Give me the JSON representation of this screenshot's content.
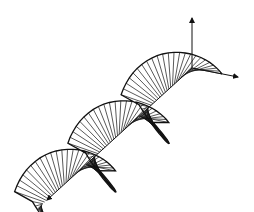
{
  "figure": {
    "width": 254,
    "height": 212,
    "background": "#ffffff",
    "stroke_color": "#111111"
  },
  "axes": {
    "origin": [
      192,
      68
    ],
    "vertical_axis": {
      "name": "vertical-axis",
      "end": [
        192,
        18
      ]
    },
    "transverse_axis": {
      "name": "transverse-axis",
      "end": [
        238,
        77
      ]
    },
    "propagation_axis": {
      "name": "propagation-axis",
      "end": [
        47,
        200
      ]
    }
  },
  "helix": {
    "turns": 2.72,
    "period_px": 72,
    "radius": 30,
    "samples_per_turn": 48,
    "e1": [
      1.0,
      0.2
    ],
    "e2_upper": [
      -0.08,
      -1.15
    ],
    "e2_lower": [
      -0.8,
      -1.05
    ],
    "lower_width_scale": 0.35,
    "upper_axis_share": 0.8
  }
}
